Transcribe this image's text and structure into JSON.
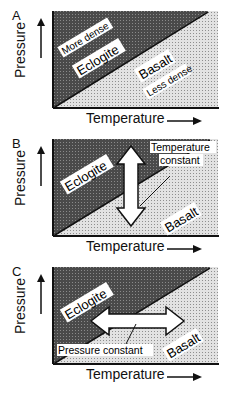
{
  "panels": [
    {
      "id": "A",
      "letter": "A",
      "ylabel": "Pressure",
      "xlabel": "Temperature",
      "upper_region": {
        "label": "Eclogite",
        "sublabel": "More dense"
      },
      "lower_region": {
        "label": "Basalt",
        "sublabel": "Less dense"
      }
    },
    {
      "id": "B",
      "letter": "B",
      "ylabel": "Pressure",
      "xlabel": "Temperature",
      "upper_region": {
        "label": "Eclogite"
      },
      "lower_region": {
        "label": "Basalt"
      },
      "arrow": {
        "direction": "vertical",
        "label_line1": "Temperature",
        "label_line2": "constant"
      }
    },
    {
      "id": "C",
      "letter": "C",
      "ylabel": "Pressure",
      "xlabel": "Temperature",
      "upper_region": {
        "label": "Eclogite"
      },
      "lower_region": {
        "label": "Basalt"
      },
      "arrow": {
        "direction": "horizontal",
        "label": "Pressure constant"
      }
    }
  ],
  "colors": {
    "dark_region": "#555555",
    "light_region": "#d4d4d4",
    "line": "#111111"
  }
}
